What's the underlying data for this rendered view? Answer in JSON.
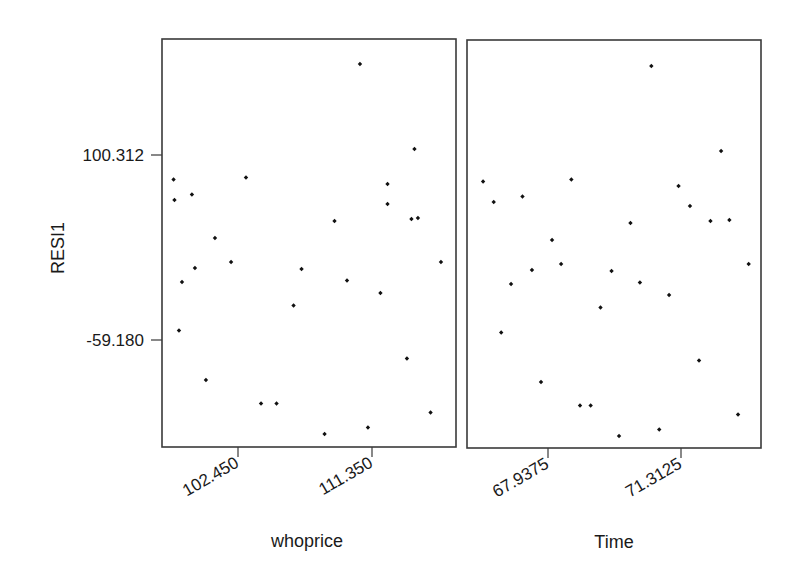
{
  "chart_data": {
    "type": "scatter",
    "title": "",
    "ylabel": "RESI1",
    "y_ticks": [
      {
        "value": 100.312,
        "label": "100.312"
      },
      {
        "value": -59.18,
        "label": "-59.180"
      }
    ],
    "grid": false,
    "legend": null,
    "panels": [
      {
        "xlabel": "whoprice",
        "x_ticks": [
          {
            "value": 102.45,
            "label": "102.450"
          },
          {
            "value": 111.35,
            "label": "111.350"
          }
        ],
        "points": [
          {
            "x": 98.17,
            "y": 79.19
          },
          {
            "x": 98.23,
            "y": 61.52
          },
          {
            "x": 99.39,
            "y": 66.26
          },
          {
            "x": 102.98,
            "y": 80.92
          },
          {
            "x": 100.92,
            "y": 28.76
          },
          {
            "x": 101.99,
            "y": 8.07
          },
          {
            "x": 99.59,
            "y": 2.89
          },
          {
            "x": 98.73,
            "y": -9.18
          },
          {
            "x": 106.67,
            "y": 2.03
          },
          {
            "x": 106.14,
            "y": -29.44
          },
          {
            "x": 98.53,
            "y": -50.99
          },
          {
            "x": 100.32,
            "y": -93.66
          },
          {
            "x": 103.98,
            "y": -113.92
          },
          {
            "x": 105.01,
            "y": -113.92
          },
          {
            "x": 110.55,
            "y": 178.77
          },
          {
            "x": 114.17,
            "y": 105.48
          },
          {
            "x": 112.38,
            "y": 75.31
          },
          {
            "x": 112.38,
            "y": 58.07
          },
          {
            "x": 108.86,
            "y": 43.41
          },
          {
            "x": 113.97,
            "y": 45.14
          },
          {
            "x": 114.4,
            "y": 46.0
          },
          {
            "x": 115.93,
            "y": 8.07
          },
          {
            "x": 109.69,
            "y": -7.88
          },
          {
            "x": 111.91,
            "y": -18.66
          },
          {
            "x": 113.67,
            "y": -75.13
          },
          {
            "x": 115.24,
            "y": -121.68
          },
          {
            "x": 111.08,
            "y": -134.62
          },
          {
            "x": 108.2,
            "y": -140.22
          }
        ]
      },
      {
        "xlabel": "Time",
        "x_ticks": [
          {
            "value": 67.9375,
            "label": "67.9375"
          },
          {
            "value": 71.3125,
            "label": "71.3125"
          }
        ],
        "points": [
          {
            "x": 66.29,
            "y": 79.19
          },
          {
            "x": 66.56,
            "y": 61.52
          },
          {
            "x": 67.29,
            "y": 66.26
          },
          {
            "x": 68.53,
            "y": 80.92
          },
          {
            "x": 68.04,
            "y": 28.76
          },
          {
            "x": 68.27,
            "y": 8.07
          },
          {
            "x": 67.53,
            "y": 2.89
          },
          {
            "x": 67.0,
            "y": -9.18
          },
          {
            "x": 69.55,
            "y": 2.03
          },
          {
            "x": 69.27,
            "y": -29.44
          },
          {
            "x": 66.75,
            "y": -50.99
          },
          {
            "x": 67.76,
            "y": -93.66
          },
          {
            "x": 68.75,
            "y": -113.92
          },
          {
            "x": 69.02,
            "y": -113.92
          },
          {
            "x": 70.56,
            "y": 178.77
          },
          {
            "x": 72.33,
            "y": 105.48
          },
          {
            "x": 71.25,
            "y": 75.31
          },
          {
            "x": 71.54,
            "y": 58.07
          },
          {
            "x": 70.03,
            "y": 43.41
          },
          {
            "x": 72.06,
            "y": 45.14
          },
          {
            "x": 72.54,
            "y": 46.0
          },
          {
            "x": 73.03,
            "y": 8.07
          },
          {
            "x": 70.27,
            "y": -7.88
          },
          {
            "x": 71.01,
            "y": -18.66
          },
          {
            "x": 71.77,
            "y": -75.13
          },
          {
            "x": 72.76,
            "y": -121.68
          },
          {
            "x": 70.76,
            "y": -134.62
          },
          {
            "x": 69.74,
            "y": -140.22
          }
        ]
      }
    ]
  }
}
